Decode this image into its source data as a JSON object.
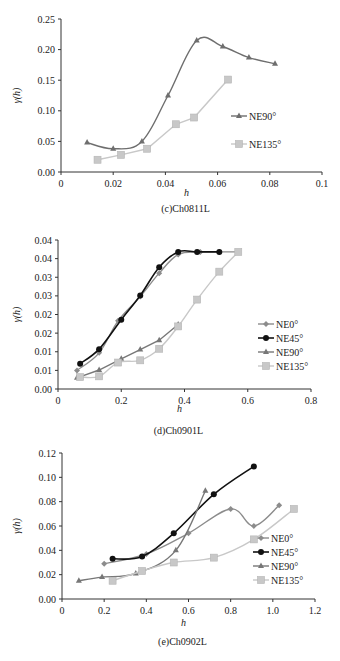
{
  "chart_data": [
    {
      "type": "line",
      "title": "(c)Ch0811L",
      "xlabel": "h",
      "ylabel": "γ(h)",
      "xlim": [
        0,
        0.1
      ],
      "ylim": [
        0,
        0.25
      ],
      "xticks": [
        "0",
        "0.02",
        "0.04",
        "0.06",
        "0.08",
        "0.1"
      ],
      "yticks": [
        "0.00",
        "0.05",
        "0.10",
        "0.15",
        "0.20",
        "0.25"
      ],
      "grid": false,
      "legend_position": "right",
      "series": [
        {
          "name": "NE90°",
          "marker": "triangle",
          "color": "#6e6e6e",
          "smooth": true,
          "x": [
            0.01,
            0.02,
            0.031,
            0.041,
            0.052,
            0.062,
            0.072,
            0.082
          ],
          "y": [
            0.048,
            0.038,
            0.05,
            0.125,
            0.215,
            0.205,
            0.187,
            0.177
          ]
        },
        {
          "name": "NE135°",
          "marker": "square",
          "color": "#c8c8c8",
          "smooth": false,
          "x": [
            0.014,
            0.023,
            0.033,
            0.044,
            0.051,
            0.064
          ],
          "y": [
            0.02,
            0.028,
            0.038,
            0.078,
            0.089,
            0.151
          ]
        }
      ]
    },
    {
      "type": "line",
      "title": "(d)Ch0901L",
      "xlabel": "h",
      "ylabel": "γ(h)",
      "xlim": [
        0,
        0.8
      ],
      "ylim": [
        0,
        0.04
      ],
      "xticks": [
        "0",
        "0.2",
        "0.4",
        "0.6",
        "0.8"
      ],
      "yticks": [
        "0.00",
        "0.01",
        "0.01",
        "0.02",
        "0.02",
        "0.03",
        "0.03",
        "0.04",
        "0.04"
      ],
      "grid": false,
      "legend_position": "right",
      "series": [
        {
          "name": "NE0°",
          "marker": "diamond",
          "color": "#8c8c8c",
          "smooth": true,
          "x": [
            0.06,
            0.13,
            0.19,
            0.26,
            0.32,
            0.38,
            0.45,
            0.51,
            0.57
          ],
          "y": [
            0.005,
            0.0097,
            0.0183,
            0.0248,
            0.0311,
            0.0361,
            0.0368,
            0.0368,
            0.0368
          ]
        },
        {
          "name": "NE45°",
          "marker": "circle",
          "color": "#111111",
          "smooth": true,
          "x": [
            0.07,
            0.13,
            0.2,
            0.26,
            0.32,
            0.38,
            0.44,
            0.51
          ],
          "y": [
            0.0068,
            0.0107,
            0.0186,
            0.0251,
            0.0327,
            0.0368,
            0.0368,
            0.0368
          ]
        },
        {
          "name": "NE90°",
          "marker": "triangle",
          "color": "#777777",
          "smooth": false,
          "x": [
            0.06,
            0.13,
            0.2,
            0.26,
            0.32,
            0.38
          ],
          "y": [
            0.003,
            0.0051,
            0.0081,
            0.0106,
            0.0131,
            0.0173
          ]
        },
        {
          "name": "NE135°",
          "marker": "square",
          "color": "#c8c8c8",
          "smooth": true,
          "x": [
            0.07,
            0.13,
            0.19,
            0.26,
            0.32,
            0.38,
            0.44,
            0.51,
            0.57
          ],
          "y": [
            0.0032,
            0.0034,
            0.0071,
            0.0077,
            0.0108,
            0.0168,
            0.024,
            0.0315,
            0.0368
          ]
        }
      ]
    },
    {
      "type": "line",
      "title": "(e)Ch0902L",
      "xlabel": "h",
      "ylabel": "γ(h)",
      "xlim": [
        0,
        1.2
      ],
      "ylim": [
        0,
        0.12
      ],
      "xticks": [
        "0",
        "0.2",
        "0.4",
        "0.6",
        "0.8",
        "1.0",
        "1.2"
      ],
      "yticks": [
        "0.00",
        "0.02",
        "0.04",
        "0.06",
        "0.08",
        "0.10",
        "0.12"
      ],
      "grid": false,
      "legend_position": "right",
      "series": [
        {
          "name": "NE0°",
          "marker": "diamond",
          "color": "#8c8c8c",
          "smooth": true,
          "x": [
            0.2,
            0.4,
            0.6,
            0.8,
            0.91,
            1.03
          ],
          "y": [
            0.029,
            0.037,
            0.054,
            0.074,
            0.06,
            0.077
          ]
        },
        {
          "name": "NE45°",
          "marker": "circle",
          "color": "#111111",
          "smooth": true,
          "x": [
            0.24,
            0.38,
            0.53,
            0.72,
            0.91
          ],
          "y": [
            0.033,
            0.035,
            0.054,
            0.086,
            0.109
          ]
        },
        {
          "name": "NE90°",
          "marker": "triangle",
          "color": "#777777",
          "smooth": true,
          "x": [
            0.08,
            0.19,
            0.35,
            0.54,
            0.68
          ],
          "y": [
            0.015,
            0.018,
            0.021,
            0.04,
            0.089
          ]
        },
        {
          "name": "NE135°",
          "marker": "square",
          "color": "#c8c8c8",
          "smooth": true,
          "x": [
            0.24,
            0.38,
            0.53,
            0.72,
            0.91,
            1.1
          ],
          "y": [
            0.015,
            0.023,
            0.03,
            0.034,
            0.049,
            0.074
          ]
        }
      ]
    }
  ],
  "layout": [
    {
      "plot": {
        "x0": 61,
        "x1": 322,
        "y0": 172,
        "y1": 19
      },
      "legend": {
        "x": 243,
        "y": 116,
        "dy": 28
      },
      "caption_y": 212,
      "xlabel_y": 196
    },
    {
      "plot": {
        "x0": 58,
        "x1": 311,
        "y0": 389,
        "y1": 240
      },
      "legend": {
        "x": 270,
        "y": 324,
        "dy": 14
      },
      "caption_y": 434,
      "xlabel_y": 412
    },
    {
      "plot": {
        "x0": 62,
        "x1": 315,
        "y0": 599,
        "y1": 453
      },
      "legend": {
        "x": 265,
        "y": 538,
        "dy": 14
      },
      "caption_y": 645,
      "xlabel_y": 626
    }
  ]
}
